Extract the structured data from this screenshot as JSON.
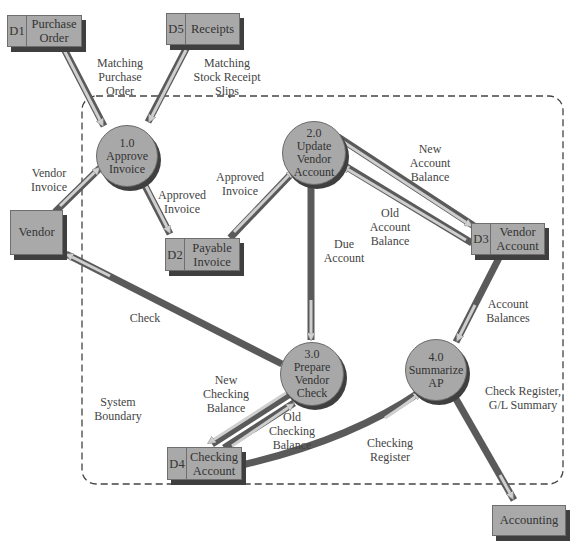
{
  "diagram": {
    "type": "data-flow-diagram",
    "boundary_label": [
      "System",
      "Boundary"
    ],
    "processes": [
      {
        "id": "1.0",
        "name": [
          "Approve",
          "Invoice"
        ]
      },
      {
        "id": "2.0",
        "name": [
          "Update",
          "Vendor",
          "Account"
        ]
      },
      {
        "id": "3.0",
        "name": [
          "Prepare",
          "Vendor",
          "Check"
        ]
      },
      {
        "id": "4.0",
        "name": [
          "Summarize",
          "AP"
        ]
      }
    ],
    "data_stores": [
      {
        "id": "D1",
        "name": [
          "Purchase",
          "Order"
        ]
      },
      {
        "id": "D5",
        "name": [
          "Receipts"
        ]
      },
      {
        "id": "D2",
        "name": [
          "Payable",
          "Invoice"
        ]
      },
      {
        "id": "D3",
        "name": [
          "Vendor",
          "Account"
        ]
      },
      {
        "id": "D4",
        "name": [
          "Checking",
          "Account"
        ]
      }
    ],
    "entities": [
      {
        "name": "Vendor"
      },
      {
        "name": "Accounting"
      }
    ],
    "flows": [
      {
        "label": [
          "Matching",
          "Purchase",
          "Order"
        ],
        "from": "D1",
        "to": "1.0"
      },
      {
        "label": [
          "Matching",
          "Stock Receipt",
          "Slips"
        ],
        "from": "D5",
        "to": "1.0"
      },
      {
        "label": [
          "Vendor",
          "Invoice"
        ],
        "from": "Vendor",
        "to": "1.0"
      },
      {
        "label": [
          "Approved",
          "Invoice"
        ],
        "from": "1.0",
        "to": "D2"
      },
      {
        "label": [
          "Approved",
          "Invoice"
        ],
        "from": "D2",
        "to": "2.0"
      },
      {
        "label": [
          "New",
          "Account",
          "Balance"
        ],
        "from": "2.0",
        "to": "D3"
      },
      {
        "label": [
          "Old",
          "Account",
          "Balance"
        ],
        "from": "D3",
        "to": "2.0"
      },
      {
        "label": [
          "Due",
          "Account"
        ],
        "from": "2.0",
        "to": "3.0"
      },
      {
        "label": [
          "Check"
        ],
        "from": "3.0",
        "to": "Vendor"
      },
      {
        "label": [
          "Account",
          "Balances"
        ],
        "from": "D3",
        "to": "4.0"
      },
      {
        "label": [
          "New",
          "Checking",
          "Balance"
        ],
        "from": "3.0",
        "to": "D4"
      },
      {
        "label": [
          "Old",
          "Checking",
          "Balance"
        ],
        "from": "D4",
        "to": "3.0"
      },
      {
        "label": [
          "Checking",
          "Register"
        ],
        "from": "D4",
        "to": "4.0"
      },
      {
        "label": [
          "Check Register,",
          "G/L Summary"
        ],
        "from": "4.0",
        "to": "Accounting"
      }
    ]
  },
  "text": {
    "p1_id": "1.0",
    "p1_l1": "Approve",
    "p1_l2": "Invoice",
    "p2_id": "2.0",
    "p2_l1": "Update",
    "p2_l2": "Vendor",
    "p2_l3": "Account",
    "p3_id": "3.0",
    "p3_l1": "Prepare",
    "p3_l2": "Vendor",
    "p3_l3": "Check",
    "p4_id": "4.0",
    "p4_l1": "Summarize",
    "p4_l2": "AP",
    "d1_id": "D1",
    "d1_l1": "Purchase",
    "d1_l2": "Order",
    "d5_id": "D5",
    "d5_l1": "Receipts",
    "d2_id": "D2",
    "d2_l1": "Payable",
    "d2_l2": "Invoice",
    "d3_id": "D3",
    "d3_l1": "Vendor",
    "d3_l2": "Account",
    "d4_id": "D4",
    "d4_l1": "Checking",
    "d4_l2": "Account",
    "e_vendor": "Vendor",
    "e_accounting": "Accounting",
    "f_mpo_1": "Matching",
    "f_mpo_2": "Purchase",
    "f_mpo_3": "Order",
    "f_msr_1": "Matching",
    "f_msr_2": "Stock Receipt",
    "f_msr_3": "Slips",
    "f_vi_1": "Vendor",
    "f_vi_2": "Invoice",
    "f_ai1_1": "Approved",
    "f_ai1_2": "Invoice",
    "f_ai2_1": "Approved",
    "f_ai2_2": "Invoice",
    "f_nab_1": "New",
    "f_nab_2": "Account",
    "f_nab_3": "Balance",
    "f_oab_1": "Old",
    "f_oab_2": "Account",
    "f_oab_3": "Balance",
    "f_da_1": "Due",
    "f_da_2": "Account",
    "f_chk": "Check",
    "f_ab_1": "Account",
    "f_ab_2": "Balances",
    "f_ncb_1": "New",
    "f_ncb_2": "Checking",
    "f_ncb_3": "Balance",
    "f_ocb_1": "Old",
    "f_ocb_2": "Checking",
    "f_ocb_3": "Balance",
    "f_cr_1": "Checking",
    "f_cr_2": "Register",
    "f_crgl_1": "Check Register,",
    "f_crgl_2": "G/L Summary",
    "sb_1": "System",
    "sb_2": "Boundary"
  },
  "colors": {
    "shape_fill": "#a9a9a9",
    "shape_shadow": "#3f3f3f",
    "flow_dark": "#555555",
    "flow_light": "#c8c8c8",
    "boundary": "#444444"
  }
}
